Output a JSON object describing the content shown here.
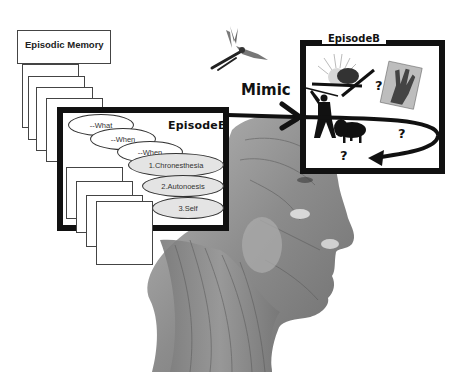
{
  "diagram": {
    "episodic_memory": {
      "title": "Episodic Memory",
      "stacked_cards_count": 4
    },
    "episode_left": {
      "title": "EpisodeB",
      "ellipses": [
        {
          "label": "--What",
          "fill": "white"
        },
        {
          "label": "--When",
          "fill": "white"
        },
        {
          "label": "--When",
          "fill": "white"
        },
        {
          "label": "1.Chronesthesia",
          "fill": "grey"
        },
        {
          "label": "2.Autonoesis",
          "fill": "grey"
        },
        {
          "label": "3.Self",
          "fill": "grey"
        }
      ],
      "lower_stacked_cards_count": 4
    },
    "mimic_label": "Mimic",
    "episode_right": {
      "title": "EpisodeB",
      "question_marks": [
        "?",
        "?",
        "?"
      ],
      "icons": [
        "sun-eclipse-icon",
        "hand-photo-icon",
        "hunter-silhouette-icon",
        "bison-silhouette-icon",
        "curved-return-arrow-icon"
      ]
    },
    "decorations": [
      "mosquito-illustration",
      "anatomical-head-illustration"
    ]
  },
  "colors": {
    "frame": "#111111",
    "ellipse_grey": "#e4e4e4",
    "anatomy_grey": "#8a8a8a"
  }
}
